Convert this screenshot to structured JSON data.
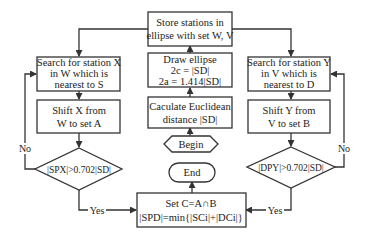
{
  "diagram": {
    "type": "flowchart",
    "nodes": {
      "store": {
        "line1": "Store stations in",
        "line2": "ellipse with set W, V"
      },
      "draw": {
        "line1": "Draw ellipse",
        "line2": "2c = |SD|",
        "line3": "2a = 1.414|SD|"
      },
      "calc": {
        "line1": "Caculate Euclidean",
        "line2": "distance |SD|"
      },
      "begin": {
        "label": "Begin"
      },
      "end": {
        "label": "End"
      },
      "setc": {
        "line1": "Set C=A∩B",
        "line2": "|SPD|=min{|SCi|+|DCi|}"
      },
      "search_x": {
        "line1": "Search for station X",
        "line2": "in W  which is",
        "line3": "nearest to S"
      },
      "shift_x": {
        "line1": "Shift X from",
        "line2": "W to set A"
      },
      "cond_x": {
        "label": "|SPX|>0.702|SD|"
      },
      "search_y": {
        "line1": "Search for station Y",
        "line2": "in V  which is",
        "line3": "nearest to D"
      },
      "shift_y": {
        "line1": "Shift Y from",
        "line2": "V to set B"
      },
      "cond_y": {
        "label": "|DPY|>0.702|SD|"
      }
    },
    "edge_labels": {
      "no_left": "No",
      "no_right": "No",
      "yes_left": "Yes",
      "yes_right": "Yes"
    },
    "colors": {
      "stroke": "#333333",
      "background": "#ffffff",
      "text": "#222222"
    }
  }
}
